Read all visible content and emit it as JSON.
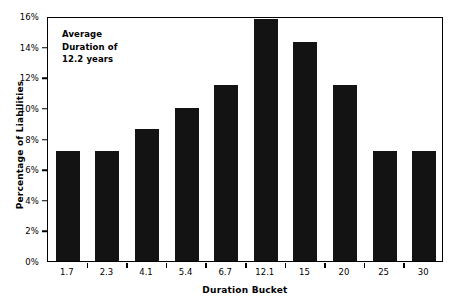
{
  "chart_data": {
    "type": "bar",
    "title": "",
    "subtitle": "",
    "xlabel": "Duration Bucket",
    "ylabel": "Percentage of Liabilities",
    "categories": [
      "1.7",
      "2.3",
      "4.1",
      "5.4",
      "6.7",
      "12.1",
      "15",
      "20",
      "25",
      "30"
    ],
    "values": [
      7.2,
      7.2,
      8.65,
      10.0,
      11.5,
      15.8,
      14.3,
      11.5,
      7.2,
      7.2
    ],
    "ylim": [
      0,
      16
    ],
    "ytick_labels": [
      "0%",
      "2%",
      "4%",
      "6%",
      "8%",
      "10%",
      "12%",
      "14%",
      "16%"
    ],
    "ytick_values": [
      0,
      2,
      4,
      6,
      8,
      10,
      12,
      14,
      16
    ],
    "grid": false,
    "legend": false,
    "bar_color": "#131313",
    "axis_color": "#000000",
    "background_color": "#ffffff",
    "annotations": [
      {
        "name": "average-duration-note",
        "lines": [
          "Average",
          "Duration of",
          "12.2 years"
        ]
      }
    ]
  },
  "annotation_lines": {
    "line1": "Average",
    "line2": "Duration of",
    "line3": "12.2 years"
  },
  "axes": {
    "x_title": "Duration Bucket",
    "y_title": "Percentage of Liabilities"
  }
}
